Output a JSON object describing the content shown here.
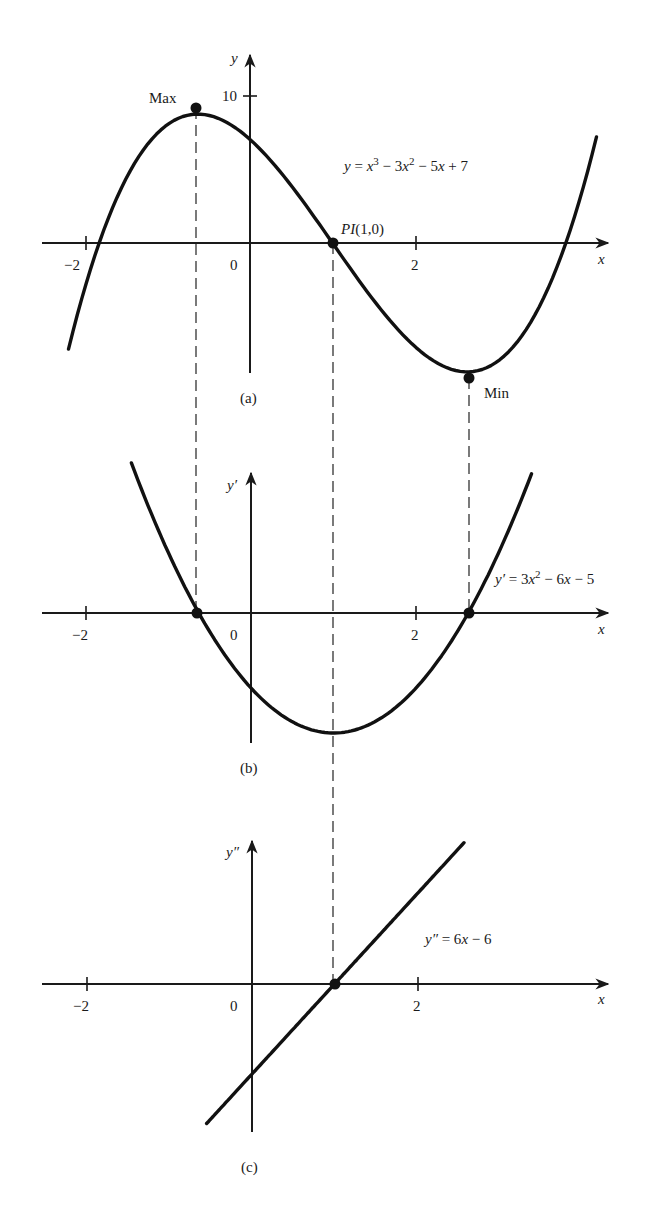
{
  "chart_data": [
    {
      "id": "a",
      "type": "line",
      "caption": "(a)",
      "equation": "y = x³ − 3x² − 5x + 7",
      "function": "x^3 - 3x^2 - 5x + 7",
      "xlabel": "x",
      "ylabel": "y",
      "x_ticks": [
        "−2",
        "0",
        "2"
      ],
      "y_ticks": [
        "10"
      ],
      "x_range": [
        -2.2,
        4.2
      ],
      "points": [
        {
          "label": "Max",
          "x": -0.63,
          "y": 8.9
        },
        {
          "label": "PI(1,0)",
          "x": 1,
          "y": 0
        },
        {
          "label": "Min",
          "x": 2.63,
          "y": -8.9
        }
      ]
    },
    {
      "id": "b",
      "type": "line",
      "caption": "(b)",
      "equation": "y′ = 3x² − 6x − 5",
      "function": "3x^2 - 6x - 5",
      "xlabel": "x",
      "ylabel": "y′",
      "x_ticks": [
        "−2",
        "0",
        "2"
      ],
      "x_range": [
        -1.45,
        3.4
      ],
      "points": [
        {
          "label": "",
          "x": -0.63,
          "y": 0
        },
        {
          "label": "",
          "x": 2.63,
          "y": 0
        }
      ],
      "vertex": {
        "x": 1,
        "y": -8
      }
    },
    {
      "id": "c",
      "type": "line",
      "caption": "(c)",
      "equation": "y″ = 6x − 6",
      "function": "6x - 6",
      "xlabel": "x",
      "ylabel": "y″",
      "x_ticks": [
        "−2",
        "0",
        "2"
      ],
      "x_range": [
        -0.55,
        2.57
      ],
      "points": [
        {
          "label": "",
          "x": 1,
          "y": 0
        }
      ]
    }
  ],
  "labels": {
    "a": {
      "caption": "(a)",
      "ylabel": "y",
      "xlabel": "x",
      "tick_neg2": "−2",
      "tick_0": "0",
      "tick_2": "2",
      "tick_10": "10",
      "max": "Max",
      "min": "Min",
      "pi": "PI",
      "pi_coords": "(1,0)",
      "eq_lhs": "y",
      "eq_eq": " = ",
      "eq_x": "x",
      "eq_p3": "3",
      "eq_mid1": " − 3",
      "eq_x2": "x",
      "eq_p2": "2",
      "eq_mid2": " − 5",
      "eq_x3": "x",
      "eq_end": " + 7"
    },
    "b": {
      "caption": "(b)",
      "ylabel": "y′",
      "xlabel": "x",
      "tick_neg2": "−2",
      "tick_0": "0",
      "tick_2": "2",
      "eq_lhs": "y′",
      "eq_eq": " = 3",
      "eq_x": "x",
      "eq_p2": "2",
      "eq_mid": " − 6",
      "eq_x2": "x",
      "eq_end": " − 5"
    },
    "c": {
      "caption": "(c)",
      "ylabel": "y″",
      "xlabel": "x",
      "tick_neg2": "−2",
      "tick_0": "0",
      "tick_2": "2",
      "eq_lhs": "y″",
      "eq_eq": " = 6",
      "eq_x": "x",
      "eq_end": " − 6"
    }
  }
}
